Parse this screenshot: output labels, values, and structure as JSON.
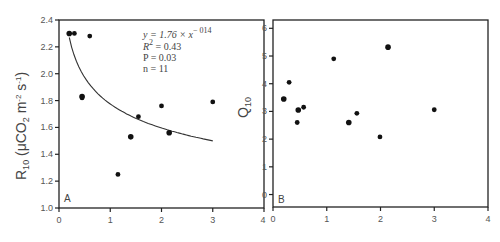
{
  "chart_data": [
    {
      "panel": "A",
      "type": "scatter",
      "title": "",
      "xlabel": "",
      "ylabel": "R10 (μCO2 m-2 s-1)",
      "xlim": [
        0,
        4
      ],
      "ylim": [
        1.0,
        2.4
      ],
      "xticks": [
        "0",
        "1",
        "2",
        "3"
      ],
      "yticks": [
        "1.0",
        "1.2",
        "1.4",
        "1.6",
        "1.8",
        "2.0",
        "2.2",
        "2.4"
      ],
      "grid": false,
      "points": [
        {
          "x": 0.2,
          "y": 2.3
        },
        {
          "x": 0.3,
          "y": 2.3
        },
        {
          "x": 0.6,
          "y": 2.28
        },
        {
          "x": 0.45,
          "y": 1.83
        },
        {
          "x": 0.45,
          "y": 1.82
        },
        {
          "x": 1.15,
          "y": 1.25
        },
        {
          "x": 1.4,
          "y": 1.53
        },
        {
          "x": 1.55,
          "y": 1.68
        },
        {
          "x": 2.0,
          "y": 1.76
        },
        {
          "x": 2.15,
          "y": 1.56
        },
        {
          "x": 3.0,
          "y": 1.79
        }
      ],
      "fit": {
        "equation": "y = 1.76 × x^-0.14",
        "a": 1.76,
        "b": -0.14,
        "x_range": [
          0.2,
          3.0
        ]
      },
      "annotations": {
        "eq_line": "y = 1.76 × x",
        "eq_exp": "− 014",
        "r2_label": "R",
        "r2_sup": "2",
        "r2_val": " = 0.43",
        "p_line": "P = 0.03",
        "n_line": "n = 11",
        "letter": "A"
      }
    },
    {
      "panel": "B",
      "type": "scatter",
      "title": "",
      "xlabel": "",
      "ylabel": "Q10",
      "xlim": [
        0,
        4
      ],
      "ylim": [
        -0.45,
        6.3
      ],
      "xticks": [
        "0",
        "1",
        "2",
        "3",
        "4"
      ],
      "yticks": [
        "0",
        "1",
        "2",
        "3",
        "4",
        "5",
        "6"
      ],
      "grid": false,
      "points": [
        {
          "x": 0.2,
          "y": 3.45
        },
        {
          "x": 0.3,
          "y": 4.05
        },
        {
          "x": 0.45,
          "y": 2.6
        },
        {
          "x": 0.47,
          "y": 3.05
        },
        {
          "x": 0.57,
          "y": 3.15
        },
        {
          "x": 1.13,
          "y": 4.9
        },
        {
          "x": 1.41,
          "y": 2.6
        },
        {
          "x": 1.56,
          "y": 2.93
        },
        {
          "x": 1.99,
          "y": 2.08
        },
        {
          "x": 2.14,
          "y": 5.32
        },
        {
          "x": 3.0,
          "y": 3.06
        }
      ],
      "annotations": {
        "letter": "B"
      }
    }
  ],
  "labels": {
    "a_ylabel_main": "R",
    "a_ylabel_sub": "10",
    "a_ylabel_rest1": " (μCO",
    "a_ylabel_sub2": "2",
    "a_ylabel_rest2": " m",
    "a_ylabel_sup1": "-2",
    "a_ylabel_rest3": " s",
    "a_ylabel_sup2": "-1",
    "a_ylabel_end": ")",
    "b_ylabel_main": "Q",
    "b_ylabel_sub": "10"
  },
  "colors": {
    "axis": "#222222",
    "marker": "#111111",
    "fit_line": "#333333",
    "text": "#555555"
  }
}
